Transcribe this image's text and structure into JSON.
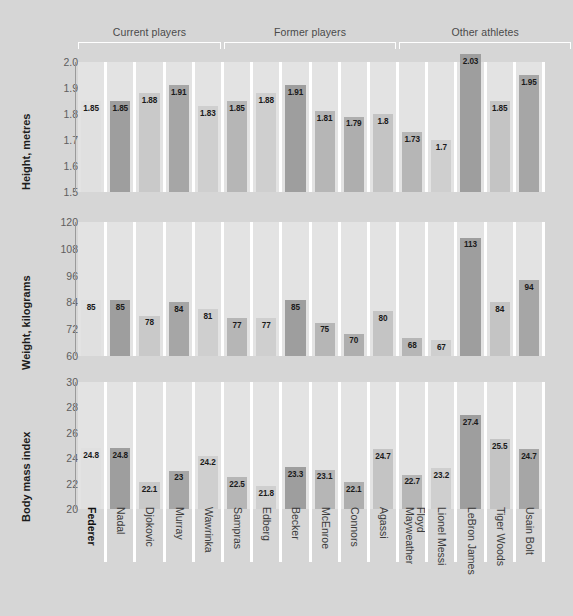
{
  "background_color": "#d6d6d6",
  "groups": [
    {
      "label": "Current players",
      "start": 0,
      "end": 4
    },
    {
      "label": "Former players",
      "start": 5,
      "end": 10
    },
    {
      "label": "Other athletes",
      "start": 11,
      "end": 16
    }
  ],
  "athletes": [
    {
      "name": "Federer",
      "highlight": true,
      "shade": "#e0e0e0"
    },
    {
      "name": "Nadal",
      "highlight": false,
      "shade": "#9e9e9e"
    },
    {
      "name": "Djokovic",
      "highlight": false,
      "shade": "#c9c9c9"
    },
    {
      "name": "Murray",
      "highlight": false,
      "shade": "#a6a6a6"
    },
    {
      "name": "Wawrinka",
      "highlight": false,
      "shade": "#cfcfcf"
    },
    {
      "name": "Sampras",
      "highlight": false,
      "shade": "#b6b6b6"
    },
    {
      "name": "Edberg",
      "highlight": false,
      "shade": "#cfcfcf"
    },
    {
      "name": "Becker",
      "highlight": false,
      "shade": "#9e9e9e"
    },
    {
      "name": "McEnroe",
      "highlight": false,
      "shade": "#b6b6b6"
    },
    {
      "name": "Connors",
      "highlight": false,
      "shade": "#aeaeae"
    },
    {
      "name": "Agassi",
      "highlight": false,
      "shade": "#c4c4c4"
    },
    {
      "name": "Floyd\nMayweather",
      "highlight": false,
      "shade": "#b6b6b6"
    },
    {
      "name": "Lionel Messi",
      "highlight": false,
      "shade": "#cfcfcf"
    },
    {
      "name": "LeBron James",
      "highlight": false,
      "shade": "#9e9e9e"
    },
    {
      "name": "Tiger Woods",
      "highlight": false,
      "shade": "#c4c4c4"
    },
    {
      "name": "Usain Bolt",
      "highlight": false,
      "shade": "#a6a6a6"
    }
  ],
  "chart_data": [
    {
      "type": "bar",
      "title": "Height, metres",
      "ylabel": "Height, metres",
      "xlabel": "",
      "ylim": [
        1.5,
        2.0
      ],
      "yticks": [
        1.5,
        1.6,
        1.7,
        1.8,
        1.9,
        2.0
      ],
      "ytick_labels": [
        "1.5",
        "1.6",
        "1.7",
        "1.8",
        "1.9",
        "2.0"
      ],
      "grid": false,
      "categories": [
        "Federer",
        "Nadal",
        "Djokovic",
        "Murray",
        "Wawrinka",
        "Sampras",
        "Edberg",
        "Becker",
        "McEnroe",
        "Connors",
        "Agassi",
        "Floyd Mayweather",
        "Lionel Messi",
        "LeBron James",
        "Tiger Woods",
        "Usain Bolt"
      ],
      "values": [
        1.85,
        1.85,
        1.88,
        1.91,
        1.83,
        1.85,
        1.88,
        1.91,
        1.81,
        1.79,
        1.8,
        1.73,
        1.7,
        2.03,
        1.85,
        1.95
      ],
      "data_labels": [
        "1.85",
        "1.85",
        "1.88",
        "1.91",
        "1.83",
        "1.85",
        "1.88",
        "1.91",
        "1.81",
        "1.79",
        "1.8",
        "1.73",
        "1.7",
        "2.03",
        "1.85",
        "1.95"
      ]
    },
    {
      "type": "bar",
      "title": "Weight, kilograms",
      "ylabel": "Weight, kilograms",
      "xlabel": "",
      "ylim": [
        60,
        120
      ],
      "yticks": [
        60,
        72,
        84,
        96,
        108,
        120
      ],
      "ytick_labels": [
        "60",
        "72",
        "84",
        "96",
        "108",
        "120"
      ],
      "grid": false,
      "categories": [
        "Federer",
        "Nadal",
        "Djokovic",
        "Murray",
        "Wawrinka",
        "Sampras",
        "Edberg",
        "Becker",
        "McEnroe",
        "Connors",
        "Agassi",
        "Floyd Mayweather",
        "Lionel Messi",
        "LeBron James",
        "Tiger Woods",
        "Usain Bolt"
      ],
      "values": [
        85,
        85,
        78,
        84,
        81,
        77,
        77,
        85,
        75,
        70,
        80,
        68,
        67,
        113,
        84,
        94
      ],
      "data_labels": [
        "85",
        "85",
        "78",
        "84",
        "81",
        "77",
        "77",
        "85",
        "75",
        "70",
        "80",
        "68",
        "67",
        "113",
        "84",
        "94"
      ]
    },
    {
      "type": "bar",
      "title": "Body mass index",
      "ylabel": "Body mass index",
      "xlabel": "",
      "ylim": [
        20,
        30
      ],
      "yticks": [
        20,
        22,
        24,
        26,
        28,
        30
      ],
      "ytick_labels": [
        "20",
        "22",
        "24",
        "26",
        "28",
        "30"
      ],
      "grid": false,
      "categories": [
        "Federer",
        "Nadal",
        "Djokovic",
        "Murray",
        "Wawrinka",
        "Sampras",
        "Edberg",
        "Becker",
        "McEnroe",
        "Connors",
        "Agassi",
        "Floyd Mayweather",
        "Lionel Messi",
        "LeBron James",
        "Tiger Woods",
        "Usain Bolt"
      ],
      "values": [
        24.8,
        24.8,
        22.1,
        23,
        24.2,
        22.5,
        21.8,
        23.3,
        23.1,
        22.1,
        24.7,
        22.7,
        23.2,
        27.4,
        25.5,
        24.7
      ],
      "data_labels": [
        "24.8",
        "24.8",
        "22.1",
        "23",
        "24.2",
        "22.5",
        "21.8",
        "23.3",
        "23.1",
        "22.1",
        "24.7",
        "22.7",
        "23.2",
        "27.4",
        "25.5",
        "24.7"
      ]
    }
  ]
}
